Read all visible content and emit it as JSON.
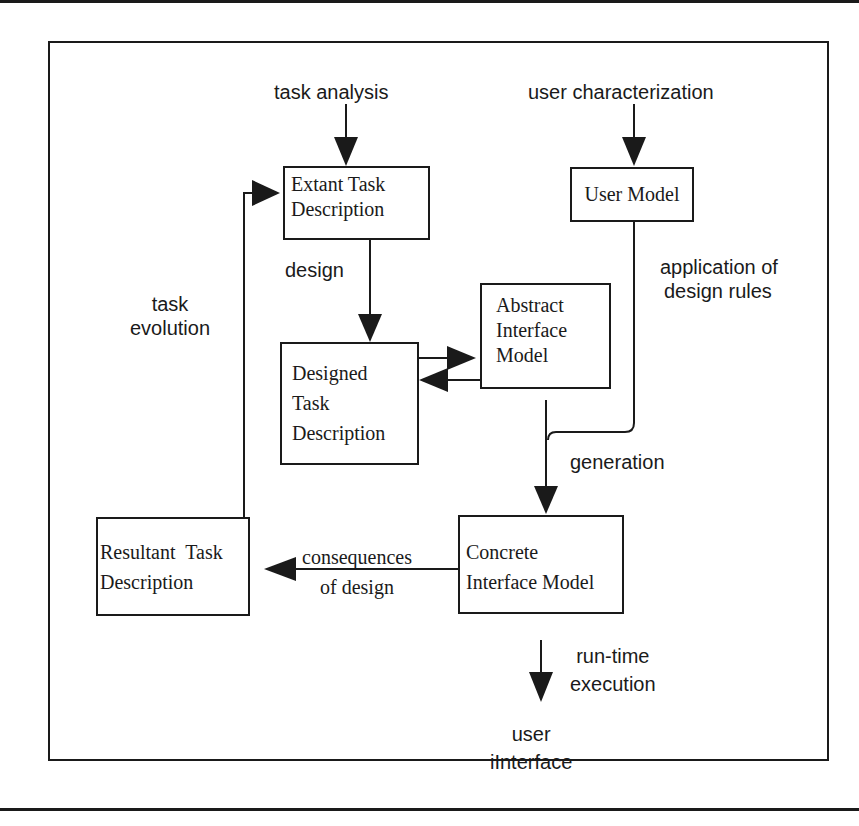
{
  "diagram": {
    "nodes": {
      "extant_task": {
        "lines": [
          "Extant Task",
          "Description"
        ]
      },
      "user_model": {
        "lines": [
          "User Model"
        ]
      },
      "abstract_interface": {
        "lines": [
          "Abstract",
          "Interface",
          "Model"
        ]
      },
      "designed_task": {
        "lines": [
          "Designed",
          "Task",
          "Description"
        ]
      },
      "resultant_task": {
        "lines": [
          "Resultant  Task",
          "Description"
        ]
      },
      "concrete_interface": {
        "lines": [
          "Concrete",
          "Interface Model"
        ]
      }
    },
    "labels": {
      "task_analysis": "task analysis",
      "user_characterization": "user characterization",
      "design": "design",
      "application_of_design_rules": [
        "application of",
        "design rules"
      ],
      "task_evolution": [
        "task",
        "evolution"
      ],
      "generation": "generation",
      "consequences_of_design": [
        "consequences",
        "of design"
      ],
      "run_time_execution": [
        "run-time",
        "execution"
      ],
      "user_interface": [
        "user",
        "iInterface"
      ]
    },
    "colors": {
      "ink": "#1a1a1a",
      "background": "#ffffff"
    }
  }
}
